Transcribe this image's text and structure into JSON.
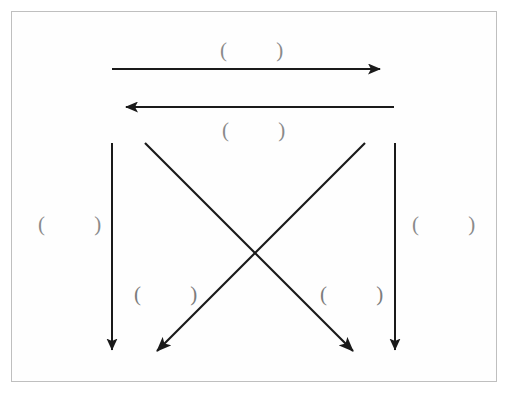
{
  "figure": {
    "background_color": "#ffffff",
    "frame": {
      "border_color": "#bfbfbf",
      "fill_color": "#fefefe"
    },
    "stroke_color": "#1a1a1a",
    "label_color": "#8a8a8a",
    "arrows": [
      {
        "id": "arrow-top-rightward",
        "name": "top-horizontal-arrow-right",
        "direction": "right",
        "x1": 112,
        "y1": 69,
        "x2": 392,
        "y2": 69
      },
      {
        "id": "arrow-second-leftward",
        "name": "second-horizontal-arrow-left",
        "direction": "left",
        "x1": 394,
        "y1": 107,
        "x2": 114,
        "y2": 107
      },
      {
        "id": "arrow-left-vertical-down",
        "name": "left-vertical-arrow-down",
        "direction": "down",
        "x1": 112,
        "y1": 143,
        "x2": 112,
        "y2": 363
      },
      {
        "id": "arrow-right-vertical-down",
        "name": "right-vertical-arrow-down",
        "direction": "down",
        "x1": 395,
        "y1": 143,
        "x2": 395,
        "y2": 363
      },
      {
        "id": "arrow-diagonal-down-right",
        "name": "diagonal-arrow-top-left-to-bottom-right",
        "direction": "down-right",
        "x1": 145,
        "y1": 143,
        "x2": 363,
        "y2": 361
      },
      {
        "id": "arrow-diagonal-down-left",
        "name": "diagonal-arrow-top-right-to-bottom-left",
        "direction": "down-left",
        "x1": 365,
        "y1": 143,
        "x2": 146,
        "y2": 362
      }
    ],
    "labels": [
      {
        "id": "label-top-out",
        "name": "label-top-outbound",
        "text": "(    )"
      },
      {
        "id": "label-top-in",
        "name": "label-top-inbound",
        "text": "(    )"
      },
      {
        "id": "label-left",
        "name": "label-left-side",
        "text": "(    )"
      },
      {
        "id": "label-right",
        "name": "label-right-side",
        "text": "(    )"
      },
      {
        "id": "label-bot-left",
        "name": "label-bottom-left-region",
        "text": "(    )"
      },
      {
        "id": "label-bot-right",
        "name": "label-bottom-right-region",
        "text": "(    )"
      }
    ]
  }
}
